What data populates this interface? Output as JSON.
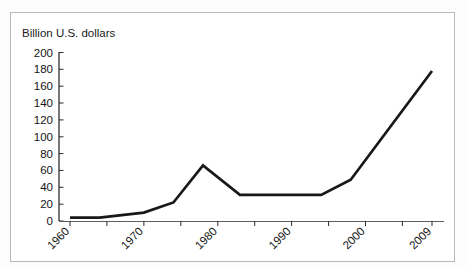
{
  "chart_data": {
    "type": "line",
    "title": "",
    "ylabel": "Billion U.S. dollars",
    "xlabel": "",
    "ylim": [
      0,
      200
    ],
    "xlim": [
      1958,
      2010
    ],
    "grid": false,
    "legend": null,
    "y_ticks": [
      0,
      20,
      40,
      60,
      80,
      100,
      120,
      140,
      160,
      180,
      200
    ],
    "y_tick_labels": [
      "0",
      "20",
      "40",
      "60",
      "80",
      "100",
      "120",
      "140",
      "160",
      "180",
      "200"
    ],
    "x_tick_labels": [
      "1960",
      "1970",
      "1980",
      "1990",
      "2000",
      "2009"
    ],
    "x_tick_years": [
      1960,
      1970,
      1980,
      1990,
      2000,
      2009
    ],
    "x_minor_tick_years": [
      1960,
      1965,
      1970,
      1975,
      1980,
      1985,
      1990,
      1995,
      2000,
      2005,
      2009
    ],
    "series": [
      {
        "name": "Billion U.S. dollars",
        "color": "#181818",
        "x": [
          1960,
          1964,
          1970,
          1974,
          1978,
          1983,
          1994,
          1998,
          2009
        ],
        "values": [
          4,
          4,
          10,
          22,
          66,
          31,
          31,
          49,
          178
        ]
      }
    ]
  },
  "axis": {
    "ylabel_text": "Billion U.S. dollars"
  },
  "colors": {
    "line": "#181818",
    "axis": "#1c1c1c",
    "frame": "#b9b9b9",
    "text": "#141414",
    "background": "#ffffff"
  }
}
